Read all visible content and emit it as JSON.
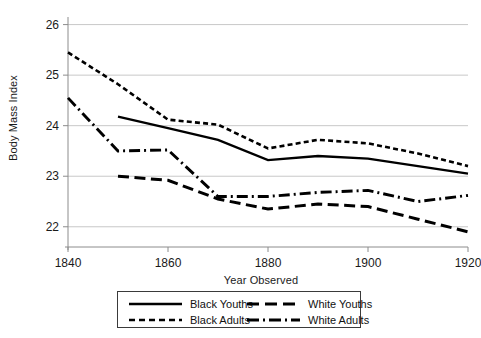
{
  "chart_data": {
    "type": "line",
    "title": "",
    "xlabel": "Year Observed",
    "ylabel": "Body Mass Index",
    "xlim": [
      1840,
      1920
    ],
    "ylim": [
      21.6,
      26.15
    ],
    "xticks": [
      1840,
      1860,
      1880,
      1900,
      1920
    ],
    "yticks": [
      22,
      23,
      24,
      25,
      26
    ],
    "xtick_labels": [
      "1840",
      "1860",
      "1880",
      "1900",
      "1920"
    ],
    "ytick_labels": [
      "22",
      "23",
      "24",
      "25",
      "26"
    ],
    "grid": "horizontal",
    "legend_position": "below-axes",
    "series": [
      {
        "name": "Black Youths",
        "style": "solid",
        "x": [
          1850,
          1860,
          1870,
          1880,
          1890,
          1900,
          1910,
          1920
        ],
        "values": [
          24.18,
          23.95,
          23.72,
          23.32,
          23.4,
          23.35,
          23.2,
          23.05
        ]
      },
      {
        "name": "Black Adults",
        "style": "dotted",
        "x": [
          1840,
          1850,
          1860,
          1870,
          1880,
          1890,
          1900,
          1910,
          1920
        ],
        "values": [
          25.45,
          24.82,
          24.12,
          24.02,
          23.55,
          23.72,
          23.65,
          23.45,
          23.2
        ]
      },
      {
        "name": "White Youths",
        "style": "dashed",
        "x": [
          1850,
          1860,
          1870,
          1880,
          1890,
          1900,
          1910,
          1920
        ],
        "values": [
          23.0,
          22.92,
          22.55,
          22.35,
          22.45,
          22.4,
          22.15,
          21.9
        ]
      },
      {
        "name": "White Adults",
        "style": "dashdot",
        "x": [
          1840,
          1850,
          1860,
          1870,
          1880,
          1890,
          1900,
          1910,
          1920
        ],
        "values": [
          24.55,
          23.5,
          23.52,
          22.6,
          22.6,
          22.68,
          22.72,
          22.5,
          22.62
        ]
      }
    ],
    "colors": {
      "line": "#000000",
      "grid": "#c8c8c8",
      "axis": "#8c8c8c",
      "text": "#1a1a1a"
    }
  },
  "legend": {
    "entries": [
      {
        "label": "Black Youths",
        "style": "solid"
      },
      {
        "label": "Black Adults",
        "style": "dotted"
      },
      {
        "label": "White Youths",
        "style": "dashed"
      },
      {
        "label": "White Adults",
        "style": "dashdot"
      }
    ]
  }
}
